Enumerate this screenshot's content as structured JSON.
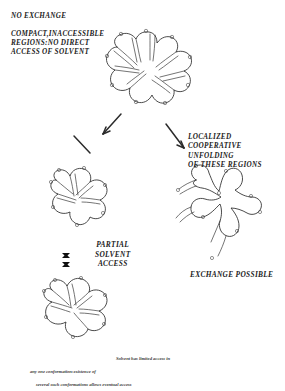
{
  "figure": {
    "title_top": "NO EXCHANGE",
    "labels": {
      "no_exchange": "NO EXCHANGE",
      "compact_regions": "COMPACT,INACCESSIBLE\nREGIONS:NO DIRECT\nACCESS OF SOLVENT",
      "localized_unfolding": "LOCALIZED\nCOOPERATIVE  UNFOLDING\nOF THESE REGIONS",
      "partial_solvent_access": "PARTIAL\nSOLVENT\nACCESS",
      "exchange_possible": "EXCHANGE  POSSIBLE"
    },
    "caption": {
      "line1": "Solvent has limited access in",
      "line2": "any one conformation:existence of",
      "line3": "several such conformations allows eventual access"
    },
    "structures": [
      {
        "name": "compact-native-conformation",
        "state": "compact",
        "description": "Compact folded protein with inaccessible interior clefts",
        "marker_count": 9
      },
      {
        "name": "partial-conformation-upper",
        "state": "partially-open",
        "description": "Partially opened conformation, upper of the fluctuating set",
        "marker_count": 6
      },
      {
        "name": "partial-conformation-lower",
        "state": "partially-open",
        "description": "Partially opened conformation, lower of the fluctuating set",
        "marker_count": 7
      },
      {
        "name": "unfolded-open-conformation",
        "state": "unfolded",
        "description": "Locally unfolded open star conformation permitting exchange",
        "marker_count": 8
      }
    ],
    "ellipsis": {
      "name": "conformation-series-ellipsis",
      "dots": 3,
      "meaning": "series of several such conformations"
    },
    "arrows": [
      {
        "name": "arrow-to-partial",
        "direction": "down-left"
      },
      {
        "name": "arrow-to-compact",
        "direction": "up-right"
      },
      {
        "name": "arrow-to-unfolded",
        "direction": "down-right"
      }
    ],
    "colors": {
      "ink": "#2b2b2b",
      "paper": "#ffffff",
      "marker": "#4a4a4a"
    }
  }
}
